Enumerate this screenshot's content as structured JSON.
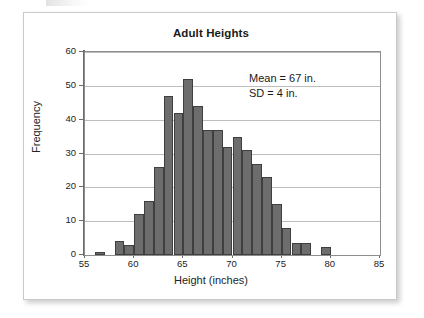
{
  "figure": {
    "title": "Adult Heights",
    "annotation": {
      "mean_line": "Mean = 67 in.",
      "sd_line": "SD = 4 in."
    }
  },
  "chart_data": {
    "type": "bar",
    "title": "Adult Heights",
    "xlabel": "Height (inches)",
    "ylabel": "Frequency",
    "xlim": [
      55,
      85
    ],
    "ylim": [
      0,
      60
    ],
    "grid": true,
    "legend": null,
    "axis_break": true,
    "bin_width": 1,
    "x_ticks": [
      55,
      60,
      65,
      70,
      75,
      80,
      85
    ],
    "y_ticks": [
      0,
      10,
      20,
      30,
      40,
      50,
      60
    ],
    "bar_color": "#6d6d6d",
    "bar_edge_color": "#3f3f3f",
    "annotations": [
      "Mean = 67 in.",
      "SD = 4 in."
    ],
    "bins": [
      {
        "start": 55,
        "end": 56,
        "value": 0
      },
      {
        "start": 56,
        "end": 57,
        "value": 1
      },
      {
        "start": 57,
        "end": 58,
        "value": 0
      },
      {
        "start": 58,
        "end": 59,
        "value": 4
      },
      {
        "start": 59,
        "end": 60,
        "value": 3
      },
      {
        "start": 60,
        "end": 61,
        "value": 12
      },
      {
        "start": 61,
        "end": 62,
        "value": 16
      },
      {
        "start": 62,
        "end": 63,
        "value": 26
      },
      {
        "start": 63,
        "end": 64,
        "value": 47
      },
      {
        "start": 64,
        "end": 65,
        "value": 42
      },
      {
        "start": 65,
        "end": 66,
        "value": 52
      },
      {
        "start": 66,
        "end": 67,
        "value": 44
      },
      {
        "start": 67,
        "end": 68,
        "value": 37
      },
      {
        "start": 68,
        "end": 69,
        "value": 37
      },
      {
        "start": 69,
        "end": 70,
        "value": 32
      },
      {
        "start": 70,
        "end": 71,
        "value": 35
      },
      {
        "start": 71,
        "end": 72,
        "value": 31
      },
      {
        "start": 72,
        "end": 73,
        "value": 27
      },
      {
        "start": 73,
        "end": 74,
        "value": 23
      },
      {
        "start": 74,
        "end": 75,
        "value": 15
      },
      {
        "start": 75,
        "end": 76,
        "value": 8
      },
      {
        "start": 76,
        "end": 77,
        "value": 3.5
      },
      {
        "start": 77,
        "end": 78,
        "value": 3.5
      },
      {
        "start": 78,
        "end": 79,
        "value": 0
      },
      {
        "start": 79,
        "end": 80,
        "value": 2.5
      }
    ],
    "categories": [
      55,
      56,
      57,
      58,
      59,
      60,
      61,
      62,
      63,
      64,
      65,
      66,
      67,
      68,
      69,
      70,
      71,
      72,
      73,
      74,
      75,
      76,
      77,
      78,
      79
    ],
    "values": [
      0,
      1,
      0,
      4,
      3,
      12,
      16,
      26,
      47,
      42,
      52,
      44,
      37,
      37,
      32,
      35,
      31,
      27,
      23,
      15,
      8,
      3.5,
      3.5,
      0,
      2.5
    ]
  }
}
